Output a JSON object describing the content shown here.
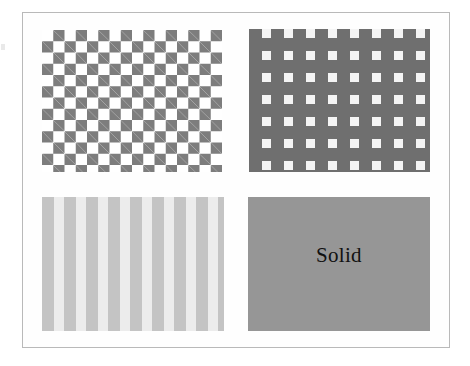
{
  "figure": {
    "background_color": "#ffffff",
    "frame_color": "#b9b9b9",
    "panel_count": 4,
    "panels": [
      {
        "id": "checker-high",
        "position": "top-left",
        "texture": "checkerboard",
        "contrast": "high",
        "label": "",
        "foreground_color": "#7d7d7d",
        "background_color": "#ffffff",
        "cell_size_px": 11,
        "period_px": 22,
        "columns": 8,
        "rows": 6
      },
      {
        "id": "gingham",
        "position": "top-right",
        "texture": "grid-mesh",
        "contrast": "high",
        "label": "",
        "foreground_color": "#6f6f6f",
        "background_color": "#ffffff",
        "cell_size_px": 9,
        "period_px": 22,
        "columns": 8,
        "rows": 6
      },
      {
        "id": "checker-low",
        "position": "bottom-left",
        "texture": "checkerboard",
        "contrast": "low",
        "label": "",
        "foreground_color": "#ececec",
        "background_color": "#c4c4c4",
        "cell_size_px": 10,
        "period_px": 22,
        "columns": 8,
        "rows": 6
      },
      {
        "id": "solid",
        "position": "bottom-right",
        "texture": "solid",
        "contrast": "none",
        "label": "Solid",
        "foreground_color": "#969696",
        "background_color": "#969696",
        "cell_size_px": 0,
        "period_px": 0,
        "columns": 0,
        "rows": 0
      }
    ]
  }
}
